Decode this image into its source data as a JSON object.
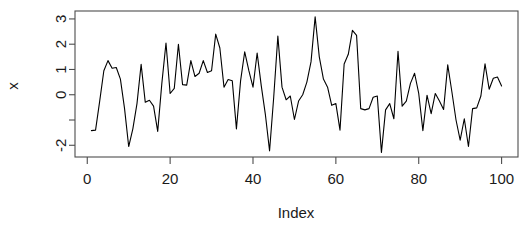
{
  "chart_data": {
    "type": "line",
    "title": "",
    "xlabel": "Index",
    "ylabel": "x",
    "xlim": [
      1,
      100
    ],
    "ylim": [
      -2.25,
      3.1
    ],
    "grid": false,
    "legend": null,
    "x_ticks": [
      0,
      20,
      40,
      60,
      80,
      100
    ],
    "x_tick_labels": [
      "0",
      "20",
      "40",
      "60",
      "80",
      "100"
    ],
    "y_ticks": [
      -2,
      -1,
      0,
      1,
      2,
      3
    ],
    "y_tick_labels": [
      "-2",
      "",
      "0",
      "1",
      "2",
      "3"
    ],
    "series": [
      {
        "name": "x",
        "color": "#000000",
        "x": [
          1,
          2,
          3,
          4,
          5,
          6,
          7,
          8,
          9,
          10,
          11,
          12,
          13,
          14,
          15,
          16,
          17,
          18,
          19,
          20,
          21,
          22,
          23,
          24,
          25,
          26,
          27,
          28,
          29,
          30,
          31,
          32,
          33,
          34,
          35,
          36,
          37,
          38,
          39,
          40,
          41,
          42,
          43,
          44,
          45,
          46,
          47,
          48,
          49,
          50,
          51,
          52,
          53,
          54,
          55,
          56,
          57,
          58,
          59,
          60,
          61,
          62,
          63,
          64,
          65,
          66,
          67,
          68,
          69,
          70,
          71,
          72,
          73,
          74,
          75,
          76,
          77,
          78,
          79,
          80,
          81,
          82,
          83,
          84,
          85,
          86,
          87,
          88,
          89,
          90,
          91,
          92,
          93,
          94,
          95,
          96,
          97,
          98,
          99,
          100
        ],
        "values": [
          -1.42,
          -1.4,
          -0.25,
          0.95,
          1.35,
          1.05,
          1.08,
          0.62,
          -0.55,
          -2.05,
          -1.35,
          -0.35,
          1.2,
          -0.3,
          -0.22,
          -0.45,
          -1.45,
          0.45,
          2.05,
          0.05,
          0.25,
          2.0,
          0.4,
          0.38,
          1.35,
          0.72,
          0.85,
          1.35,
          0.88,
          0.95,
          2.4,
          1.85,
          0.3,
          0.6,
          0.55,
          -1.35,
          0.55,
          1.7,
          0.95,
          0.3,
          1.65,
          0.35,
          -0.8,
          -2.22,
          -0.1,
          2.32,
          0.3,
          -0.2,
          -0.05,
          -0.98,
          -0.25,
          0.0,
          0.5,
          1.3,
          3.08,
          1.5,
          0.62,
          0.3,
          -0.42,
          -0.35,
          -1.4,
          1.22,
          1.6,
          2.55,
          2.35,
          -0.55,
          -0.6,
          -0.55,
          -0.1,
          -0.05,
          -2.28,
          -0.6,
          -0.35,
          -0.95,
          1.72,
          -0.45,
          -0.25,
          0.45,
          0.85,
          0.05,
          -1.42,
          -0.02,
          -0.75,
          0.05,
          -0.25,
          -0.58,
          1.18,
          0.12,
          -1.0,
          -1.8,
          -0.95,
          -2.05,
          -0.55,
          -0.52,
          -0.05,
          1.22,
          0.22,
          0.65,
          0.7,
          0.35
        ]
      }
    ]
  },
  "plot_geometry": {
    "box_left": 75,
    "box_right": 518,
    "box_top": 11,
    "box_bottom": 157
  }
}
